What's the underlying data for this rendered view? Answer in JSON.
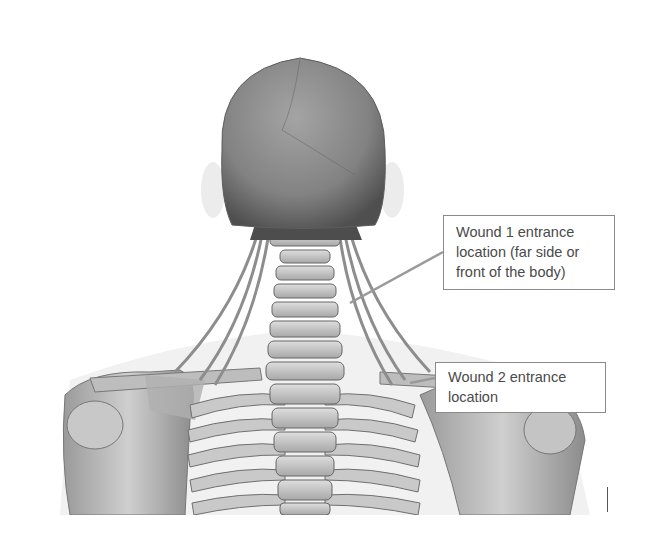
{
  "figure": {
    "palette": {
      "background": "#ffffff",
      "skull_dark": "#6b6b6b",
      "skull_mid": "#8e8e8e",
      "bone_light": "#d6d6d6",
      "bone_mid": "#b4b4b4",
      "bone_shadow": "#5a5a5a",
      "callout_border": "#8a8a8a",
      "callout_text": "#4a4a4a",
      "leader_line": "#9a9a9a"
    }
  },
  "callouts": [
    {
      "id": "wound-1",
      "lines": [
        "Wound 1 entrance",
        "location (far side or",
        "front of the body)"
      ]
    },
    {
      "id": "wound-2",
      "lines": [
        "Wound 2 entrance",
        "location"
      ]
    }
  ]
}
